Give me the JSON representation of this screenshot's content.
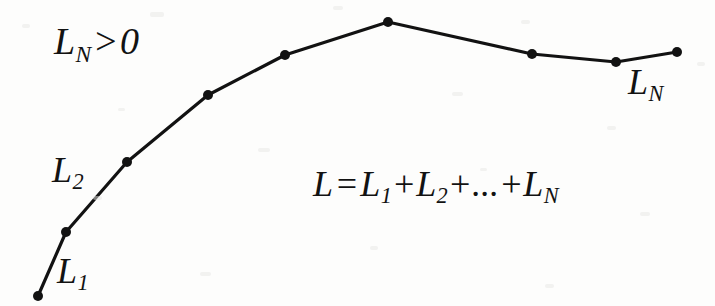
{
  "figure": {
    "background_color": "#fdfdfc",
    "stroke_color": "#121212",
    "width": 715,
    "height": 306
  },
  "labels": {
    "constraint": {
      "var": "L",
      "sub": "N",
      "relation": ">",
      "value": "0",
      "text": "L_N>0"
    },
    "segment_first": {
      "var": "L",
      "sub": "1",
      "text": "L_1"
    },
    "segment_second": {
      "var": "L",
      "sub": "2",
      "text": "L_2"
    },
    "segment_last": {
      "var": "L",
      "sub": "N",
      "text": "L_N"
    },
    "formula": {
      "lhs": "L",
      "equals": "=",
      "term1_var": "L",
      "term1_sub": "1",
      "plus1": "+",
      "term2_var": "L",
      "term2_sub": "2",
      "plus2": "+",
      "ellipsis": "...",
      "plus3": "+",
      "termN_var": "L",
      "termN_sub": "N",
      "text": "L = L_1+L_2+...+L_N"
    }
  },
  "chart_data": {
    "type": "line",
    "xlabel": "",
    "ylabel": "",
    "xlim": [
      0,
      715
    ],
    "ylim": [
      306,
      0
    ],
    "grid": false,
    "legend": "none",
    "marker": "filled-circle",
    "marker_radius": 5,
    "line_width": 3.2,
    "series": [
      {
        "name": "polyline",
        "points": [
          {
            "x": 38,
            "y": 296
          },
          {
            "x": 66,
            "y": 232
          },
          {
            "x": 127,
            "y": 162
          },
          {
            "x": 208,
            "y": 95
          },
          {
            "x": 285,
            "y": 55
          },
          {
            "x": 388,
            "y": 22
          },
          {
            "x": 532,
            "y": 54
          },
          {
            "x": 616,
            "y": 62
          },
          {
            "x": 677,
            "y": 52
          }
        ]
      }
    ],
    "annotations": [
      {
        "text": "L_N>0",
        "x": 54,
        "y": 48
      },
      {
        "text": "L_2",
        "x": 70,
        "y": 174
      },
      {
        "text": "L_1",
        "x": 78,
        "y": 278
      },
      {
        "text": "L_N",
        "x": 650,
        "y": 88
      },
      {
        "text": "L = L_1+L_2+...+L_N",
        "x": 420,
        "y": 190
      }
    ]
  }
}
